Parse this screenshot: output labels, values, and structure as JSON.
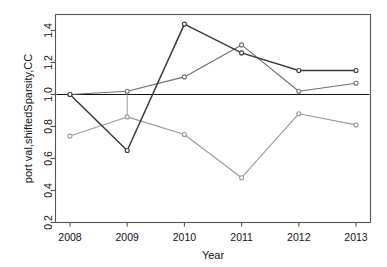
{
  "chart_data": {
    "type": "line",
    "title": "",
    "subtitle": "",
    "xlabel": "Year",
    "ylabel": "port val,shiftedSparsity,CC",
    "x": [
      2008,
      2009,
      2010,
      2011,
      2012,
      2013
    ],
    "categories": [
      "2008",
      "2009",
      "2010",
      "2011",
      "2012",
      "2013"
    ],
    "xtick_labels": [
      "2008",
      "2009",
      "2010",
      "2011",
      "2012",
      "2013"
    ],
    "ytick_labels": [
      "0.2",
      "0.4",
      "0.6",
      "0.8",
      "1.0",
      "1.2",
      "1.4"
    ],
    "ytick_values": [
      0.2,
      0.4,
      0.6,
      0.8,
      1.0,
      1.2,
      1.4
    ],
    "xlim": [
      2008,
      2013
    ],
    "ylim": [
      0.2,
      1.5
    ],
    "grid": false,
    "legend": "none",
    "series": [
      {
        "name": "port val",
        "color": "#3a3a3a",
        "values": [
          1.0,
          0.65,
          1.44,
          1.26,
          1.15,
          1.15
        ]
      },
      {
        "name": "shiftedSparsity",
        "color": "#6e6e6e",
        "values": [
          1.0,
          1.02,
          1.11,
          1.31,
          1.02,
          1.07
        ]
      },
      {
        "name": "CC",
        "color": "#9a9a9a",
        "values": [
          0.74,
          0.86,
          0.75,
          0.48,
          0.88,
          0.81
        ]
      }
    ],
    "reference_line": {
      "name": "baseline",
      "orientation": "horizontal",
      "value": 1.0,
      "color": "#111111"
    },
    "connector_segments": [
      {
        "name": "vertical-connector-2009",
        "x": 2009,
        "y_from": 1.02,
        "y_to": 0.86,
        "color": "#9a9a9a"
      }
    ],
    "marker": "circle",
    "axis_color": "#555555",
    "plot_bg": "#ffffff"
  }
}
